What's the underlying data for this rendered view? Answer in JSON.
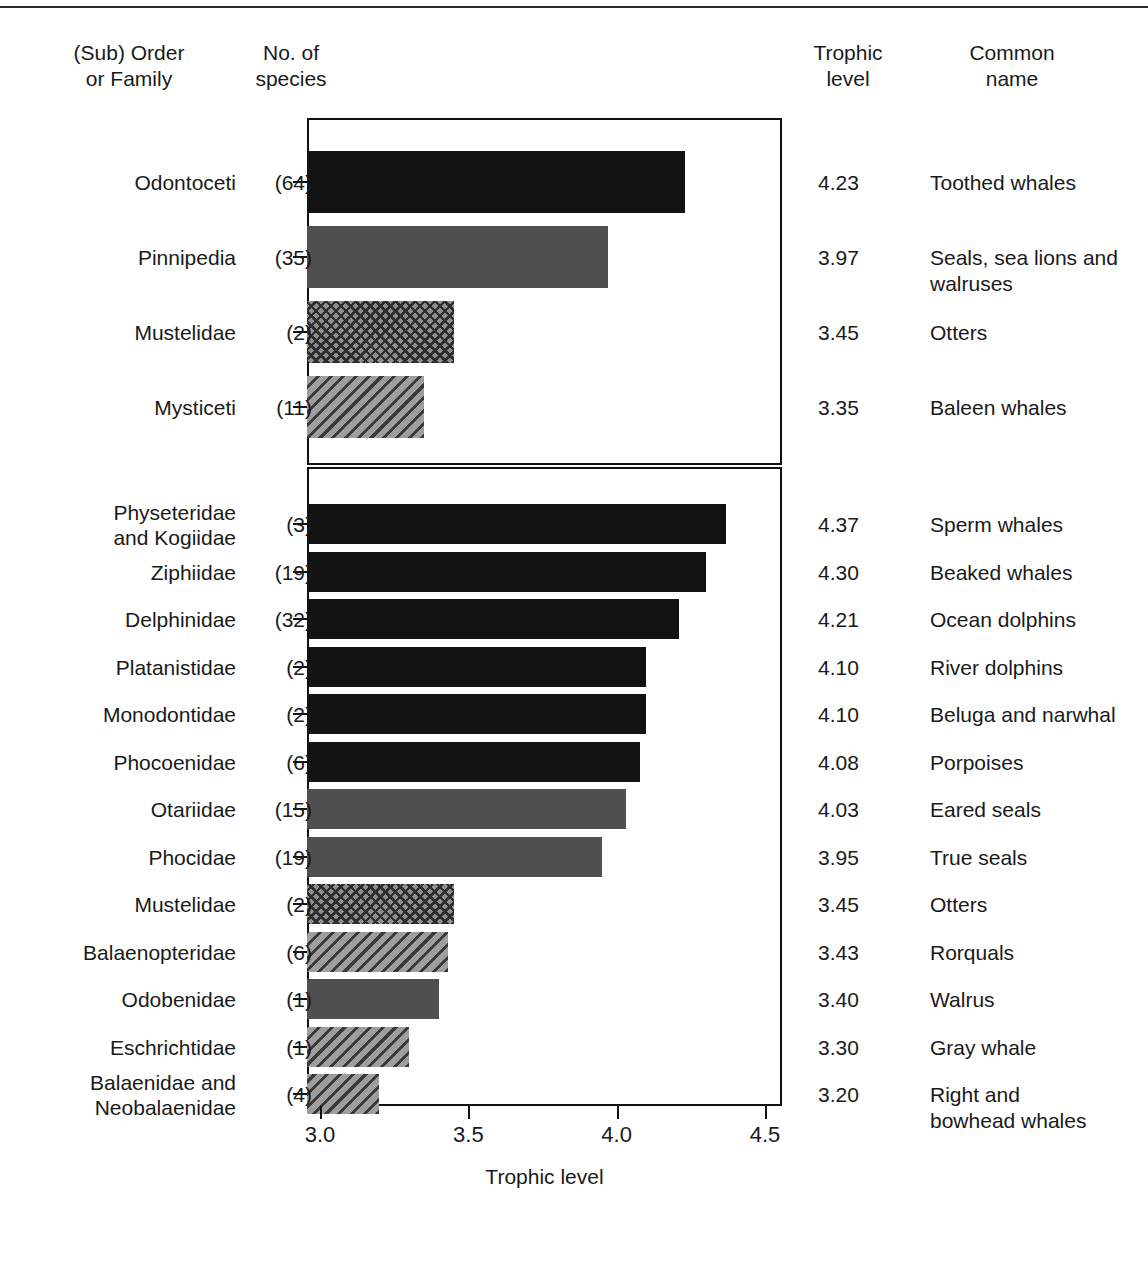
{
  "headers": {
    "taxon": "(Sub) Order\nor Family",
    "taxon_line1": "(Sub) Order",
    "taxon_line2": "or Family",
    "species_line1": "No. of",
    "species_line2": "species",
    "trophic_line1": "Trophic",
    "trophic_line2": "level",
    "common_line1": "Common",
    "common_line2": "name"
  },
  "axis": {
    "title": "Trophic level",
    "ticks": [
      "3.0",
      "3.5",
      "4.0",
      "4.5"
    ],
    "tick_values": [
      3.0,
      3.5,
      4.0,
      4.5
    ]
  },
  "chart_data": {
    "type": "bar",
    "orientation": "horizontal",
    "title": "",
    "xlabel": "Trophic level",
    "ylabel": "",
    "xlim": [
      2.95,
      4.55
    ],
    "grid": false,
    "legend": "none",
    "panels": [
      {
        "name": "higher-taxa",
        "categories": [
          "Odontoceti",
          "Pinnipedia",
          "Mustelidae",
          "Mysticeti"
        ],
        "values": [
          4.23,
          3.97,
          3.45,
          3.35
        ],
        "species_counts": [
          "(64)",
          "(35)",
          "(2)",
          "(11)"
        ],
        "trophic_labels": [
          "4.23",
          "3.97",
          "3.45",
          "3.35"
        ],
        "common_names": [
          "Toothed whales",
          "Seals, sea lions and\nwalruses",
          "Otters",
          "Baleen whales"
        ],
        "fills": [
          "solid-black",
          "solid-gray",
          "crosshatch",
          "hatch"
        ]
      },
      {
        "name": "families",
        "categories": [
          "Physeteridae and Kogiidae",
          "Ziphiidae",
          "Delphinidae",
          "Platanistidae",
          "Monodontidae",
          "Phocoenidae",
          "Otariidae",
          "Phocidae",
          "Mustelidae",
          "Balaenopteridae",
          "Odobenidae",
          "Eschrichtidae",
          "Balaenidae and Neobalaenidae"
        ],
        "values": [
          4.37,
          4.3,
          4.21,
          4.1,
          4.1,
          4.08,
          4.03,
          3.95,
          3.45,
          3.43,
          3.4,
          3.3,
          3.2
        ],
        "species_counts": [
          "(3)",
          "(19)",
          "(32)",
          "(2)",
          "(2)",
          "(6)",
          "(15)",
          "(19)",
          "(2)",
          "(6)",
          "(1)",
          "(1)",
          "(4)"
        ],
        "trophic_labels": [
          "4.37",
          "4.30",
          "4.21",
          "4.10",
          "4.10",
          "4.08",
          "4.03",
          "3.95",
          "3.45",
          "3.43",
          "3.40",
          "3.30",
          "3.20"
        ],
        "common_names": [
          "Sperm whales",
          "Beaked whales",
          "Ocean dolphins",
          "River dolphins",
          "Beluga and narwhal",
          "Porpoises",
          "Eared seals",
          "True seals",
          "Otters",
          "Rorquals",
          "Walrus",
          "Gray whale",
          "Right and\nbowhead whales"
        ],
        "fills": [
          "solid-black",
          "solid-black",
          "solid-black",
          "solid-black",
          "solid-black",
          "solid-black",
          "solid-gray",
          "solid-gray",
          "crosshatch",
          "hatch",
          "solid-gray",
          "hatch",
          "hatch"
        ]
      }
    ]
  },
  "rows_top": [
    {
      "taxon": "Odontoceti",
      "taxon_lines": [
        "Odontoceti"
      ],
      "count": "(64)",
      "value": 4.23,
      "trophic": "4.23",
      "common_lines": [
        "Toothed whales"
      ],
      "fill": "solid-black"
    },
    {
      "taxon": "Pinnipedia",
      "taxon_lines": [
        "Pinnipedia"
      ],
      "count": "(35)",
      "value": 3.97,
      "trophic": "3.97",
      "common_lines": [
        "Seals, sea lions and",
        "walruses"
      ],
      "fill": "solid-gray"
    },
    {
      "taxon": "Mustelidae",
      "taxon_lines": [
        "Mustelidae"
      ],
      "count": "(2)",
      "value": 3.45,
      "trophic": "3.45",
      "common_lines": [
        "Otters"
      ],
      "fill": "crosshatch"
    },
    {
      "taxon": "Mysticeti",
      "taxon_lines": [
        "Mysticeti"
      ],
      "count": "(11)",
      "value": 3.35,
      "trophic": "3.35",
      "common_lines": [
        "Baleen whales"
      ],
      "fill": "hatch"
    }
  ],
  "rows_bottom": [
    {
      "taxon": "Physeteridae and Kogiidae",
      "taxon_lines": [
        "Physeteridae",
        "and Kogiidae"
      ],
      "count": "(3)",
      "value": 4.37,
      "trophic": "4.37",
      "common_lines": [
        "Sperm whales"
      ],
      "fill": "solid-black"
    },
    {
      "taxon": "Ziphiidae",
      "taxon_lines": [
        "Ziphiidae"
      ],
      "count": "(19)",
      "value": 4.3,
      "trophic": "4.30",
      "common_lines": [
        "Beaked whales"
      ],
      "fill": "solid-black"
    },
    {
      "taxon": "Delphinidae",
      "taxon_lines": [
        "Delphinidae"
      ],
      "count": "(32)",
      "value": 4.21,
      "trophic": "4.21",
      "common_lines": [
        "Ocean dolphins"
      ],
      "fill": "solid-black"
    },
    {
      "taxon": "Platanistidae",
      "taxon_lines": [
        "Platanistidae"
      ],
      "count": "(2)",
      "value": 4.1,
      "trophic": "4.10",
      "common_lines": [
        "River dolphins"
      ],
      "fill": "solid-black"
    },
    {
      "taxon": "Monodontidae",
      "taxon_lines": [
        "Monodontidae"
      ],
      "count": "(2)",
      "value": 4.1,
      "trophic": "4.10",
      "common_lines": [
        "Beluga and narwhal"
      ],
      "fill": "solid-black"
    },
    {
      "taxon": "Phocoenidae",
      "taxon_lines": [
        "Phocoenidae"
      ],
      "count": "(6)",
      "value": 4.08,
      "trophic": "4.08",
      "common_lines": [
        "Porpoises"
      ],
      "fill": "solid-black"
    },
    {
      "taxon": "Otariidae",
      "taxon_lines": [
        "Otariidae"
      ],
      "count": "(15)",
      "value": 4.03,
      "trophic": "4.03",
      "common_lines": [
        "Eared seals"
      ],
      "fill": "solid-gray"
    },
    {
      "taxon": "Phocidae",
      "taxon_lines": [
        "Phocidae"
      ],
      "count": "(19)",
      "value": 3.95,
      "trophic": "3.95",
      "common_lines": [
        "True seals"
      ],
      "fill": "solid-gray"
    },
    {
      "taxon": "Mustelidae",
      "taxon_lines": [
        "Mustelidae"
      ],
      "count": "(2)",
      "value": 3.45,
      "trophic": "3.45",
      "common_lines": [
        "Otters"
      ],
      "fill": "crosshatch"
    },
    {
      "taxon": "Balaenopteridae",
      "taxon_lines": [
        "Balaenopteridae"
      ],
      "count": "(6)",
      "value": 3.43,
      "trophic": "3.43",
      "common_lines": [
        "Rorquals"
      ],
      "fill": "hatch"
    },
    {
      "taxon": "Odobenidae",
      "taxon_lines": [
        "Odobenidae"
      ],
      "count": "(1)",
      "value": 3.4,
      "trophic": "3.40",
      "common_lines": [
        "Walrus"
      ],
      "fill": "solid-gray"
    },
    {
      "taxon": "Eschrichtidae",
      "taxon_lines": [
        "Eschrichtidae"
      ],
      "count": "(1)",
      "value": 3.3,
      "trophic": "3.30",
      "common_lines": [
        "Gray whale"
      ],
      "fill": "hatch"
    },
    {
      "taxon": "Balaenidae and Neobalaenidae",
      "taxon_lines": [
        "Balaenidae and",
        "Neobalaenidae"
      ],
      "count": "(4)",
      "value": 3.2,
      "trophic": "3.20",
      "common_lines": [
        "Right and",
        "bowhead whales"
      ],
      "fill": "hatch"
    }
  ]
}
